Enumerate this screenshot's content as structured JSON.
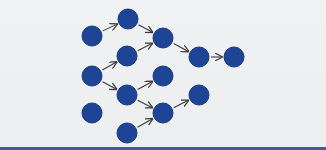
{
  "diagram": {
    "type": "directed-graph",
    "colors": {
      "node_fill": "#1e4595",
      "node_stroke": "#163a7e",
      "edge": "#3b3b3b",
      "background": "#eef0f1",
      "bottom_bar": "#3d5f8f"
    },
    "node_radius": 10,
    "nodes": [
      {
        "id": "A",
        "x": 92,
        "y": 36
      },
      {
        "id": "B",
        "x": 128,
        "y": 19
      },
      {
        "id": "C",
        "x": 163,
        "y": 38
      },
      {
        "id": "D",
        "x": 127,
        "y": 56
      },
      {
        "id": "E",
        "x": 92,
        "y": 76
      },
      {
        "id": "F",
        "x": 127,
        "y": 95
      },
      {
        "id": "G",
        "x": 163,
        "y": 76
      },
      {
        "id": "H",
        "x": 92,
        "y": 113
      },
      {
        "id": "I",
        "x": 163,
        "y": 113
      },
      {
        "id": "J",
        "x": 127,
        "y": 133
      },
      {
        "id": "K",
        "x": 199,
        "y": 57
      },
      {
        "id": "L",
        "x": 234,
        "y": 57
      },
      {
        "id": "M",
        "x": 199,
        "y": 95
      }
    ],
    "edges": [
      {
        "from": "A",
        "to": "B"
      },
      {
        "from": "B",
        "to": "C"
      },
      {
        "from": "D",
        "to": "C"
      },
      {
        "from": "E",
        "to": "D"
      },
      {
        "from": "E",
        "to": "F"
      },
      {
        "from": "F",
        "to": "G"
      },
      {
        "from": "F",
        "to": "I"
      },
      {
        "from": "J",
        "to": "I"
      },
      {
        "from": "I",
        "to": "M"
      },
      {
        "from": "C",
        "to": "K"
      },
      {
        "from": "K",
        "to": "L"
      }
    ]
  }
}
